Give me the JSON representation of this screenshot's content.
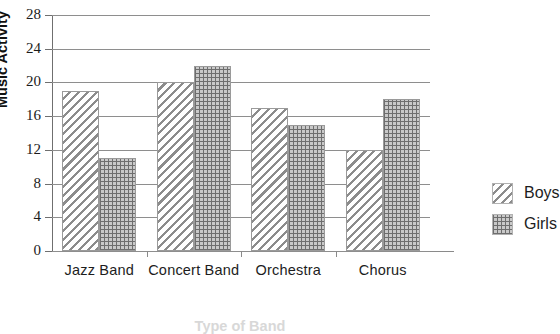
{
  "chart_data": {
    "type": "bar",
    "title": "",
    "categories": [
      "Jazz Band",
      "Concert Band",
      "Orchestra",
      "Chorus"
    ],
    "series": [
      {
        "name": "Boys",
        "values": [
          19,
          20,
          17,
          12
        ],
        "pattern": "diagonal-hatch"
      },
      {
        "name": "Girls",
        "values": [
          11,
          22,
          15,
          18
        ],
        "pattern": "dotted-grid"
      }
    ],
    "xlabel": "Type of Band",
    "ylabel": "Music Activity",
    "ylim": [
      0,
      28
    ],
    "ytick_step": 4,
    "yticks": [
      0,
      4,
      8,
      12,
      16,
      20,
      24,
      28
    ],
    "ytick_labels": [
      "0",
      "4",
      "8",
      "12",
      "16",
      "20",
      "24",
      "28"
    ],
    "grid": "horizontal",
    "legend_position": "right",
    "colors": {
      "hatch": "#8c8c8c",
      "dotfill": "#c9c9c9",
      "dotline": "#6e6e6e",
      "gridline": "#8e8e8e",
      "axis": "#6f6f6f",
      "text": "#1d1d1d",
      "background": "#ffffff"
    }
  },
  "legend": {
    "items": [
      {
        "label": "Boys"
      },
      {
        "label": "Girls"
      }
    ]
  },
  "axes": {
    "y_title": "Music Activity",
    "x_title": "Type of Band"
  }
}
